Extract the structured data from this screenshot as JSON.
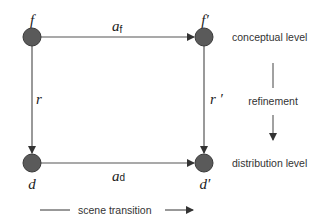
{
  "diagram": {
    "nodes": {
      "f": {
        "label": "f",
        "x": 32,
        "y": 37
      },
      "f_prime": {
        "label": "f′",
        "x": 204,
        "y": 37
      },
      "d": {
        "label": "d",
        "x": 32,
        "y": 163
      },
      "d_prime": {
        "label": "d′",
        "x": 204,
        "y": 163
      }
    },
    "edges": {
      "top": {
        "label": "a",
        "subscript": "f"
      },
      "bottom": {
        "label": "a",
        "subscript": "d"
      },
      "left": {
        "label": "r"
      },
      "right": {
        "label": "r ′"
      }
    },
    "levels": {
      "top": "conceptual level",
      "middle": "refinement",
      "bottom": "distribution level"
    },
    "legend": {
      "label": "scene transition"
    },
    "colors": {
      "node_fill": "#5a5a5a",
      "node_stroke": "#3a3a3a",
      "line": "#555555"
    }
  }
}
